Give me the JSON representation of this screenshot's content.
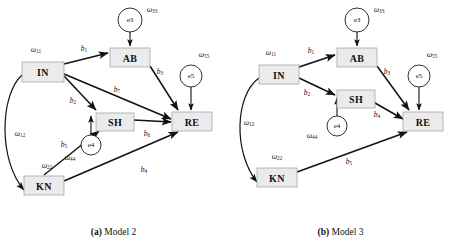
{
  "figure": {
    "panels": [
      {
        "id": "model-2",
        "caption_tag": "(a)",
        "caption_text": "Model 2",
        "nodes": [
          {
            "id": "IN",
            "label": "IN",
            "type": "rect",
            "x": 22,
            "y": 62,
            "w": 42,
            "h": 20
          },
          {
            "id": "AB",
            "label": "AB",
            "type": "rect",
            "x": 110,
            "y": 48,
            "w": 40,
            "h": 19
          },
          {
            "id": "SH",
            "label": "SH",
            "type": "rect",
            "x": 96,
            "y": 113,
            "w": 38,
            "h": 18
          },
          {
            "id": "RE",
            "label": "RE",
            "type": "rect",
            "x": 172,
            "y": 112,
            "w": 40,
            "h": 19
          },
          {
            "id": "KN",
            "label": "KN",
            "type": "rect",
            "x": 24,
            "y": 176,
            "w": 40,
            "h": 19
          },
          {
            "id": "e3",
            "label": "e3",
            "type": "circle",
            "x": 130,
            "y": 20,
            "r": 12
          },
          {
            "id": "e5",
            "label": "e5",
            "type": "circle",
            "x": 191,
            "y": 76,
            "r": 11
          },
          {
            "id": "e4",
            "label": "e4",
            "type": "circle",
            "x": 91,
            "y": 145,
            "r": 10
          }
        ],
        "variance_labels": [
          {
            "id": "w11",
            "base": "ω",
            "sub": "11",
            "x": 36,
            "y": 49
          },
          {
            "id": "w33",
            "base": "ω",
            "sub": "33",
            "x": 152,
            "y": 9
          },
          {
            "id": "w55",
            "base": "ω",
            "sub": "55",
            "x": 204,
            "y": 54
          },
          {
            "id": "w44",
            "base": "ω",
            "sub": "44",
            "x": 70,
            "y": 157
          },
          {
            "id": "w22",
            "base": "ω",
            "sub": "22",
            "x": 47,
            "y": 165
          },
          {
            "id": "w12",
            "base": "ω",
            "sub": "12",
            "x": 20,
            "y": 133
          }
        ],
        "path_labels": [
          {
            "id": "b1",
            "base": "b",
            "sub": "1",
            "x": 84,
            "y": 48
          },
          {
            "id": "b2",
            "base": "b",
            "sub": "2",
            "x": 73,
            "y": 100
          },
          {
            "id": "b3",
            "base": "b",
            "sub": "3",
            "x": 160,
            "y": 71
          },
          {
            "id": "b7",
            "base": "b",
            "sub": "7",
            "x": 117,
            "y": 89
          },
          {
            "id": "b6",
            "base": "b",
            "sub": "6",
            "x": 147,
            "y": 133
          },
          {
            "id": "b5",
            "base": "b",
            "sub": "5",
            "x": 64,
            "y": 144
          },
          {
            "id": "b4",
            "base": "b",
            "sub": "4",
            "x": 144,
            "y": 169
          }
        ],
        "edges": [
          {
            "from": "IN",
            "to": "AB",
            "label": "b1"
          },
          {
            "from": "IN",
            "to": "SH",
            "label": "b2"
          },
          {
            "from": "IN",
            "to": "RE",
            "label": "b7"
          },
          {
            "from": "AB",
            "to": "RE",
            "label": "b3"
          },
          {
            "from": "SH",
            "to": "RE",
            "label": "b6"
          },
          {
            "from": "KN",
            "to": "SH",
            "label": "b5"
          },
          {
            "from": "KN",
            "to": "RE",
            "label": "b4"
          },
          {
            "from": "e3",
            "to": "AB",
            "label": ""
          },
          {
            "from": "e5",
            "to": "RE",
            "label": ""
          },
          {
            "from": "e4",
            "to": "SH",
            "label": ""
          },
          {
            "from": "IN",
            "to": "KN",
            "label": "w12",
            "style": "double-curve"
          }
        ]
      },
      {
        "id": "model-3",
        "caption_tag": "(b)",
        "caption_text": "Model 3",
        "nodes": [
          {
            "id": "IN",
            "label": "IN",
            "type": "rect",
            "x": 32,
            "y": 65,
            "w": 40,
            "h": 19
          },
          {
            "id": "AB",
            "label": "AB",
            "type": "rect",
            "x": 110,
            "y": 48,
            "w": 40,
            "h": 19
          },
          {
            "id": "SH",
            "label": "SH",
            "type": "rect",
            "x": 110,
            "y": 90,
            "w": 38,
            "h": 18
          },
          {
            "id": "RE",
            "label": "RE",
            "type": "rect",
            "x": 176,
            "y": 112,
            "w": 40,
            "h": 19
          },
          {
            "id": "KN",
            "label": "KN",
            "type": "rect",
            "x": 30,
            "y": 168,
            "w": 40,
            "h": 19
          },
          {
            "id": "e3",
            "label": "e3",
            "type": "circle",
            "x": 130,
            "y": 20,
            "r": 12
          },
          {
            "id": "e5",
            "label": "e5",
            "type": "circle",
            "x": 192,
            "y": 76,
            "r": 11
          },
          {
            "id": "e4",
            "label": "e4",
            "type": "circle",
            "x": 110,
            "y": 126,
            "r": 10
          }
        ],
        "variance_labels": [
          {
            "id": "w11",
            "base": "ω",
            "sub": "11",
            "x": 44,
            "y": 52
          },
          {
            "id": "w33",
            "base": "ω",
            "sub": "33",
            "x": 152,
            "y": 9
          },
          {
            "id": "w55",
            "base": "ω",
            "sub": "55",
            "x": 205,
            "y": 54
          },
          {
            "id": "w44",
            "base": "ω",
            "sub": "44",
            "x": 85,
            "y": 135
          },
          {
            "id": "w22",
            "base": "ω",
            "sub": "22",
            "x": 50,
            "y": 156
          },
          {
            "id": "w12",
            "base": "ω",
            "sub": "12",
            "x": 22,
            "y": 122
          }
        ],
        "path_labels": [
          {
            "id": "b1",
            "base": "b",
            "sub": "1",
            "x": 84,
            "y": 50
          },
          {
            "id": "b2",
            "base": "b",
            "sub": "2",
            "x": 80,
            "y": 92
          },
          {
            "id": "b3",
            "base": "b",
            "sub": "3",
            "x": 160,
            "y": 71
          },
          {
            "id": "b4",
            "base": "b",
            "sub": "4",
            "x": 150,
            "y": 114
          },
          {
            "id": "b5",
            "base": "b",
            "sub": "5",
            "x": 122,
            "y": 161
          }
        ],
        "edges": [
          {
            "from": "IN",
            "to": "AB",
            "label": "b1"
          },
          {
            "from": "IN",
            "to": "SH",
            "label": "b2"
          },
          {
            "from": "AB",
            "to": "RE",
            "label": "b3"
          },
          {
            "from": "SH",
            "to": "RE",
            "label": "b4"
          },
          {
            "from": "KN",
            "to": "RE",
            "label": "b5"
          },
          {
            "from": "e3",
            "to": "AB",
            "label": ""
          },
          {
            "from": "e5",
            "to": "RE",
            "label": ""
          },
          {
            "from": "e4",
            "to": "SH",
            "label": ""
          },
          {
            "from": "IN",
            "to": "KN",
            "label": "w12",
            "style": "double-curve"
          }
        ]
      }
    ],
    "colors": {
      "node_fill": "#ebebeb",
      "node_stroke": "#9a9a9a",
      "edge": "#111111",
      "text": "#111111",
      "background": "#ffffff"
    }
  }
}
